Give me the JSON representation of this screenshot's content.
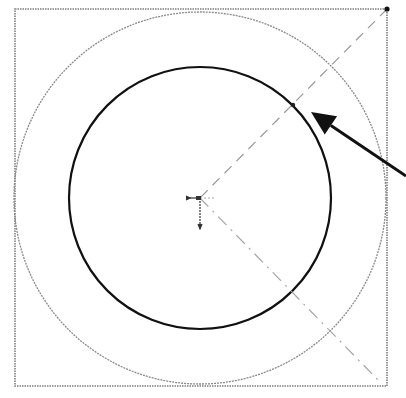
{
  "diagram": {
    "type": "cad-sketch",
    "canvas": {
      "width": 406,
      "height": 398,
      "background": "#ffffff"
    },
    "square": {
      "x1": 15,
      "y1": 9,
      "x2": 387,
      "y2": 386,
      "stroke": "#808080",
      "style": "dotted"
    },
    "center": {
      "x": 200,
      "y": 198
    },
    "outer_circle": {
      "r": 186,
      "stroke": "#8a8a8a",
      "width": 1.2
    },
    "inner_circle": {
      "r": 131,
      "stroke": "#111111",
      "width": 2.2
    },
    "construction_lines": [
      {
        "from": [
          387,
          9
        ],
        "to": [
          200,
          198
        ],
        "stroke": "#9a9a9a",
        "dash": "10,6"
      },
      {
        "from": [
          200,
          198
        ],
        "to": [
          380,
          382
        ],
        "stroke": "#a5a5a5",
        "dash": "10,6,2,6"
      }
    ],
    "corner_point": {
      "x": 387,
      "y": 9
    },
    "intersection_point": {
      "x": 293,
      "y": 105
    },
    "origin_marker": {
      "x": 200,
      "y": 198
    },
    "arrow": {
      "from": [
        406,
        176
      ],
      "to": [
        311,
        112
      ],
      "stroke": "#111111",
      "width": 3
    }
  }
}
